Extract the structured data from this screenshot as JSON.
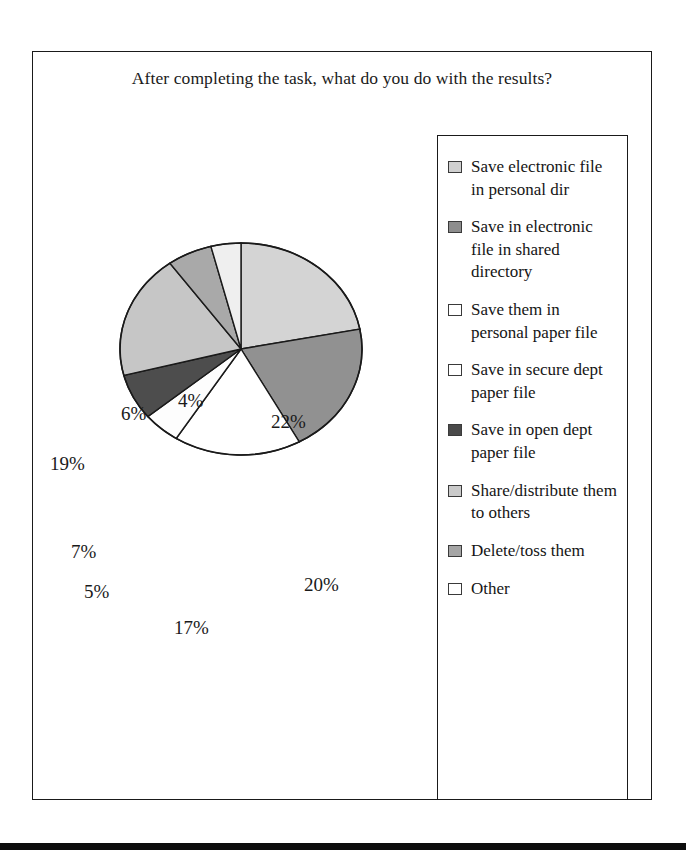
{
  "chart_data": {
    "type": "pie",
    "title": "After completing the task, what do you do with the results?",
    "xlabel": "",
    "ylabel": "",
    "legend_position": "right",
    "grid": false,
    "categories": [
      "Save electronic file in personal dir",
      "Save in electronic file in shared directory",
      "Save them in personal paper file",
      "Save in secure dept paper file",
      "Save in open dept paper file",
      "Share/distribute them to others",
      "Delete/toss them",
      "Other"
    ],
    "values": [
      22,
      20,
      17,
      5,
      7,
      19,
      6,
      4
    ],
    "value_labels": [
      "22%",
      "20%",
      "17%",
      "5%",
      "7%",
      "19%",
      "6%",
      "4%"
    ],
    "colors": [
      "#d4d4d4",
      "#919191",
      "#ffffff",
      "#fdfdfd",
      "#4d4d4d",
      "#c6c6c6",
      "#a9a9a9",
      "#efefef"
    ],
    "slice_border_color": "#1a1a1a",
    "units": "percent"
  },
  "legend": {
    "items": [
      {
        "label": "Save electronic file in personal dir",
        "color": "#cfcfcf"
      },
      {
        "label": "Save in electronic file in shared directory",
        "color": "#8d8d8d"
      },
      {
        "label": "Save them in personal paper file",
        "color": "#ffffff"
      },
      {
        "label": "Save in secure dept paper file",
        "color": "#ffffff"
      },
      {
        "label": "Save in open dept paper file",
        "color": "#4a4a4a"
      },
      {
        "label": "Share/distribute them to others",
        "color": "#cacaca"
      },
      {
        "label": "Delete/toss them",
        "color": "#a5a5a5"
      },
      {
        "label": "Other",
        "color": "#ffffff"
      }
    ]
  },
  "pie_labels": [
    {
      "text": "22%",
      "left": 238,
      "top": 289
    },
    {
      "text": "20%",
      "left": 271,
      "top": 452
    },
    {
      "text": "17%",
      "left": 141,
      "top": 495
    },
    {
      "text": "5%",
      "left": 51,
      "top": 459
    },
    {
      "text": "7%",
      "left": 38,
      "top": 419
    },
    {
      "text": "19%",
      "left": 17,
      "top": 331
    },
    {
      "text": "6%",
      "left": 88,
      "top": 281
    },
    {
      "text": "4%",
      "left": 145,
      "top": 268
    }
  ]
}
